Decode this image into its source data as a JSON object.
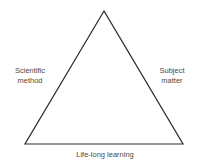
{
  "diagram": {
    "type": "triangle",
    "vertices": {
      "apex": [
        104,
        11
      ],
      "bottom_left": [
        25,
        144
      ],
      "bottom_right": [
        183,
        144
      ]
    },
    "stroke_color": "#2a2a2a",
    "text_color": "#4a4a4a",
    "labels": {
      "left_side": {
        "line1": "Scientific",
        "line2": "method"
      },
      "right_side": {
        "line1": "Subject",
        "line2": "matter"
      },
      "base": "Life-long learning"
    }
  }
}
